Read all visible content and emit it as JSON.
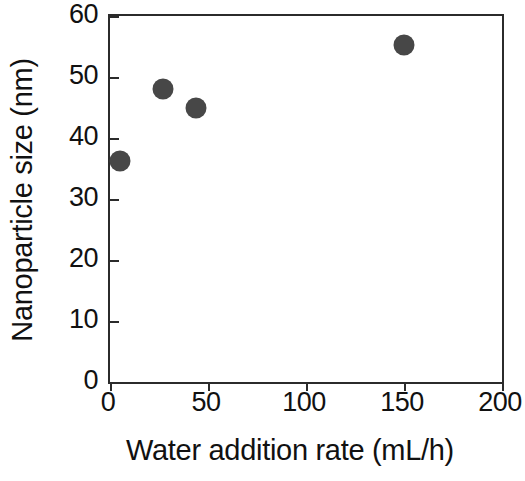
{
  "chart_data": {
    "type": "scatter",
    "title": "",
    "xlabel": "Water addition rate (mL/h)",
    "ylabel": "Nanoparticle size (nm)",
    "xlim": [
      0,
      200
    ],
    "ylim": [
      0,
      60
    ],
    "xticks": [
      0,
      50,
      100,
      150,
      200
    ],
    "yticks": [
      0,
      10,
      20,
      30,
      40,
      50,
      60
    ],
    "xtick_labels": [
      "0",
      "50",
      "100",
      "150",
      "200"
    ],
    "ytick_labels": [
      "0",
      "10",
      "20",
      "30",
      "40",
      "50",
      "60"
    ],
    "grid": false,
    "legend": null,
    "series": [
      {
        "name": "Nanoparticle size",
        "marker": "filled-circle",
        "color": "#474747",
        "points": [
          {
            "x": 5,
            "y": 36.2
          },
          {
            "x": 27,
            "y": 48.0
          },
          {
            "x": 44,
            "y": 45.0
          },
          {
            "x": 150,
            "y": 55.3
          }
        ]
      }
    ]
  },
  "axes": {
    "frame_color": "#2b2b2b",
    "background": "#ffffff"
  }
}
